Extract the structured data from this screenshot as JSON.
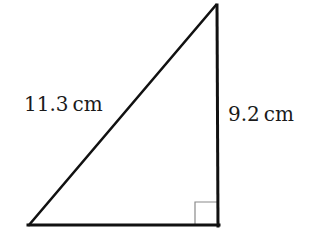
{
  "diagram": {
    "type": "right-triangle",
    "colors": {
      "stroke": "#111111",
      "right_angle_marker": "#888888",
      "text": "#1a1a1a",
      "background": "#ffffff"
    },
    "vertices": {
      "top": [
        216,
        5
      ],
      "bottom_left": [
        29,
        225
      ],
      "bottom_right": [
        218,
        225
      ]
    },
    "sides": {
      "hypotenuse": {
        "label": "11.3 cm",
        "value": 11.3,
        "unit": "cm"
      },
      "vertical_leg": {
        "label": "9.2 cm",
        "value": 9.2,
        "unit": "cm"
      },
      "base": {
        "label": "",
        "value": null,
        "unit": "cm"
      }
    },
    "right_angle_marker": {
      "corner": "bottom_right",
      "size": 23
    }
  }
}
